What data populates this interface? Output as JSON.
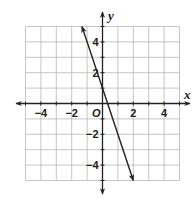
{
  "chart_data": {
    "type": "line",
    "title": "",
    "xlabel": "x",
    "ylabel": "y",
    "origin_label": "O",
    "xlim": [
      -5,
      5
    ],
    "ylim": [
      -5,
      5
    ],
    "grid": true,
    "grid_step": 1,
    "x_ticks": [
      -4,
      -2,
      2,
      4
    ],
    "y_ticks": [
      4,
      2,
      -2,
      -4
    ],
    "x_tick_labels": [
      "−4",
      "−2",
      "2",
      "4"
    ],
    "y_tick_labels": [
      "4",
      "2",
      "−2",
      "−4"
    ],
    "series": [
      {
        "name": "line",
        "equation": "y = -3x + 1",
        "slope": -3,
        "intercept": 1,
        "x": [
          -1.333,
          2
        ],
        "y": [
          5,
          -5
        ],
        "arrows_both_ends": true
      }
    ],
    "legend": null
  },
  "colors": {
    "grid": "#b8b8b8",
    "axis": "#222222",
    "line": "#222222",
    "background": "#ffffff"
  }
}
